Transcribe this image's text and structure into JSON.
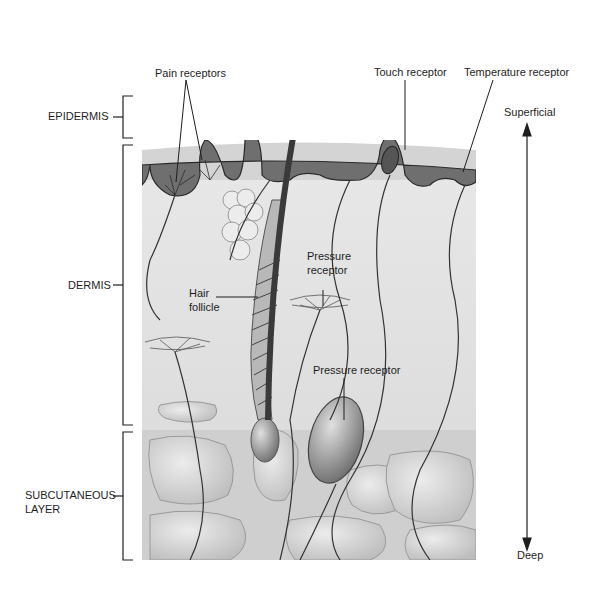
{
  "diagram": {
    "layers": [
      {
        "label": "EPIDERMIS"
      },
      {
        "label": "DERMIS"
      },
      {
        "label_line1": "SUBCUTANEOUS",
        "label_line2": "LAYER"
      }
    ],
    "structures": {
      "pain": "Pain receptors",
      "touch": "Touch receptor",
      "temperature": "Temperature receptor",
      "pressure_upper_line1": "Pressure",
      "pressure_upper_line2": "receptor",
      "hair_line1": "Hair",
      "hair_line2": "follicle",
      "pressure_lower": "Pressure receptor"
    },
    "orientation": {
      "top": "Superficial",
      "bottom": "Deep"
    },
    "colors": {
      "epidermis_dark": "#6e6e6e",
      "epidermis_light": "#d2d2d2",
      "dermis": "#e4e4e4",
      "subcutaneous": "#c8c8c8",
      "ink": "#1e1e1e"
    }
  }
}
